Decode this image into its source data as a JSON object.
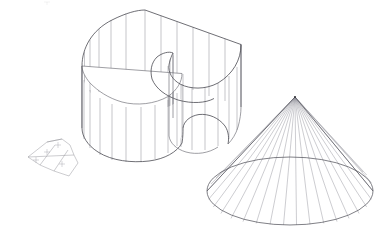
{
  "document": {
    "title": "Developable Surface Study",
    "background_color": "#ffffff",
    "width": 391,
    "height": 245,
    "line_color_outline": "#4a4a52",
    "line_color_ruling": "#8a8a92"
  },
  "objects": [
    {
      "id": "curved-wall",
      "name": "Curved Ruled Wall Surface",
      "type": "ruled-surface",
      "ruling_count": 26,
      "has_top_cap": true,
      "description": "Kidney shaped vertical ruled wall with flat semicircular cap"
    },
    {
      "id": "cone",
      "name": "Cone",
      "type": "cone",
      "ruling_count": 23,
      "apex": {
        "x": 295,
        "y": 97
      },
      "base_center": {
        "x": 290,
        "y": 192
      },
      "base_rx": 83,
      "base_ry": 34
    },
    {
      "id": "flat-pattern",
      "name": "Unrolled Flat Pattern Piece",
      "type": "development",
      "panel_count": 3
    }
  ],
  "geometry": {
    "curved_wall": {
      "top_rim": [
        [
          82.0,
          66.0
        ],
        [
          84.5,
          52.0
        ],
        [
          90.0,
          40.0
        ],
        [
          99.0,
          29.0
        ],
        [
          111.0,
          20.0
        ],
        [
          126.0,
          13.5
        ],
        [
          145.0,
          10.0
        ],
        [
          241.0,
          44.5
        ],
        [
          241.0,
          56.0
        ],
        [
          237.0,
          67.0
        ],
        [
          229.0,
          76.0
        ],
        [
          218.0,
          83.0
        ],
        [
          205.0,
          87.0
        ],
        [
          192.0,
          87.5
        ],
        [
          181.0,
          84.5
        ],
        [
          173.0,
          79.5
        ],
        [
          169.0,
          73.0
        ],
        [
          168.0,
          66.0
        ],
        [
          170.0,
          59.5
        ],
        [
          173.0,
          55.5
        ],
        [
          173.0,
          53.0
        ],
        [
          169.0,
          51.5
        ],
        [
          163.0,
          52.5
        ],
        [
          157.0,
          56.0
        ],
        [
          152.0,
          62.0
        ],
        [
          150.0,
          69.0
        ],
        [
          151.0,
          77.0
        ],
        [
          156.0,
          85.5
        ],
        [
          164.0,
          93.0
        ],
        [
          175.0,
          99.0
        ],
        [
          188.0,
          102.5
        ],
        [
          200.0,
          103.0
        ],
        [
          210.0,
          101.0
        ],
        [
          214.0,
          98.5
        ]
      ],
      "bottom_rim": [
        [
          82.0,
          128.0
        ],
        [
          84.0,
          138.0
        ],
        [
          90.0,
          147.0
        ],
        [
          100.0,
          154.0
        ],
        [
          113.0,
          159.0
        ],
        [
          128.0,
          161.5
        ],
        [
          144.0,
          161.0
        ],
        [
          159.0,
          157.5
        ],
        [
          171.0,
          151.5
        ],
        [
          179.0,
          144.0
        ],
        [
          183.0,
          135.5
        ],
        [
          183.0,
          128.0
        ],
        [
          185.0,
          121.5
        ],
        [
          190.0,
          117.0
        ],
        [
          198.0,
          114.5
        ],
        [
          207.0,
          115.0
        ],
        [
          216.0,
          118.0
        ],
        [
          223.0,
          123.5
        ],
        [
          227.0,
          130.0
        ],
        [
          228.0,
          137.0
        ],
        [
          241.0,
          107.0
        ]
      ],
      "cap_edge": [
        [
          112.0,
          97.0
        ],
        [
          125.0,
          101.0
        ],
        [
          140.0,
          102.5
        ],
        [
          155.0,
          101.0
        ],
        [
          168.0,
          96.5
        ],
        [
          177.0,
          90.0
        ],
        [
          182.0,
          82.0
        ],
        [
          182.0,
          73.5
        ]
      ]
    },
    "cone": {
      "base_samples": 23
    }
  },
  "labels": {
    "corner_mark": ""
  }
}
